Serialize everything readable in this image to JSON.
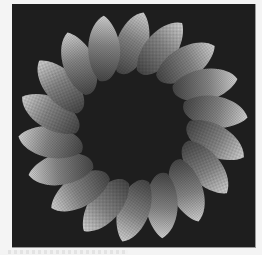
{
  "image": {
    "description": "Rendered twisted torus ring of shaded petal-shaped lobes on a dark background",
    "background_color": "#1e1e1e",
    "page_color": "#f4f4f4",
    "ring": {
      "petal_count": 18,
      "center": [
        121,
        123
      ],
      "inner_radius": 55,
      "outer_radius": 112,
      "highlight_color": "#d8d8d8",
      "shadow_color": "#4a4a4a"
    }
  }
}
